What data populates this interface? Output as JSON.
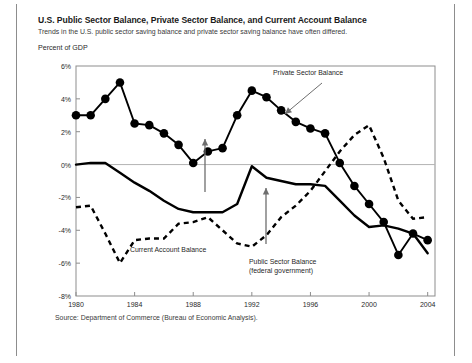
{
  "figure": {
    "title": "U.S. Public Sector Balance, Private Sector Balance, and Current Account Balance",
    "subtitle": "Trends in the U.S. public sector saving balance and private sector saving balance have often differed.",
    "unit_label": "Percent of GDP",
    "source": "Source: Department of Commerce (Bureau of Economic Analysis)."
  },
  "annotations": {
    "private": "Private Sector Balance",
    "current_account": "Current Account Balance",
    "public_line1": "Public Sector Balance",
    "public_line2": "(federal government)"
  },
  "colors": {
    "ink": "#000000",
    "frame": "#8d8d8d",
    "gridline": "#b4b4b4",
    "annotation_arrow": "#6e6e6e"
  },
  "chart_data": {
    "type": "line",
    "title": "U.S. Public Sector Balance, Private Sector Balance, and Current Account Balance",
    "xlabel": "",
    "ylabel": "Percent of GDP",
    "xlim": [
      1980,
      2004.5
    ],
    "ylim": [
      -8,
      6
    ],
    "ytick_step": 2,
    "yticks": [
      6,
      4,
      2,
      0,
      -2,
      -4,
      -6,
      -8
    ],
    "ytick_labels": [
      "6%",
      "4%",
      "2%",
      "0%",
      "-2%",
      "-4%",
      "-6%",
      "-8%"
    ],
    "xticks": [
      1980,
      1984,
      1988,
      1992,
      1996,
      2000,
      2004
    ],
    "xtick_labels": [
      "1980",
      "1984",
      "1988",
      "1992",
      "1996",
      "2000",
      "2004"
    ],
    "grid": "horizontal-zero-only",
    "legend": "annotations-with-arrows",
    "series": [
      {
        "name": "Private Sector Balance",
        "style": "line-with-round-markers",
        "x": [
          1980,
          1981,
          1982,
          1983,
          1984,
          1985,
          1986,
          1987,
          1988,
          1989,
          1990,
          1991,
          1992,
          1993,
          1994,
          1995,
          1996,
          1997,
          1998,
          1999,
          2000,
          2001,
          2002,
          2003,
          2004
        ],
        "values": [
          3.0,
          3.0,
          4.0,
          5.0,
          2.5,
          2.4,
          1.9,
          1.2,
          0.1,
          0.8,
          1.0,
          3.0,
          4.5,
          4.1,
          3.3,
          2.6,
          2.2,
          1.9,
          0.1,
          -1.3,
          -2.4,
          -3.5,
          -5.5,
          -4.2,
          -4.6
        ]
      },
      {
        "name": "Current Account Balance",
        "style": "solid-line",
        "x": [
          1980,
          1981,
          1982,
          1983,
          1984,
          1985,
          1986,
          1987,
          1988,
          1989,
          1990,
          1991,
          1992,
          1993,
          1994,
          1995,
          1996,
          1997,
          1998,
          1999,
          2000,
          2001,
          2002,
          2003,
          2004
        ],
        "values": [
          0.0,
          0.1,
          0.1,
          -0.5,
          -1.1,
          -1.6,
          -2.2,
          -2.7,
          -2.9,
          -2.9,
          -2.9,
          -2.4,
          -0.1,
          -0.8,
          -1.0,
          -1.2,
          -1.2,
          -1.3,
          -2.2,
          -3.1,
          -3.8,
          -3.7,
          -3.9,
          -4.2,
          -5.4
        ]
      },
      {
        "name": "Public Sector Balance (federal government)",
        "style": "dashed-line",
        "x": [
          1980,
          1981,
          1982,
          1983,
          1984,
          1985,
          1986,
          1987,
          1988,
          1989,
          1990,
          1991,
          1992,
          1993,
          1994,
          1995,
          1996,
          1997,
          1998,
          1999,
          2000,
          2001,
          2002,
          2003,
          2004
        ],
        "values": [
          -2.6,
          -2.5,
          -4.2,
          -6.0,
          -4.6,
          -4.5,
          -4.5,
          -3.6,
          -3.5,
          -3.2,
          -4.0,
          -4.8,
          -5.0,
          -4.3,
          -3.2,
          -2.5,
          -1.6,
          -0.4,
          0.8,
          1.8,
          2.4,
          0.4,
          -2.2,
          -3.3,
          -3.2
        ]
      }
    ]
  }
}
